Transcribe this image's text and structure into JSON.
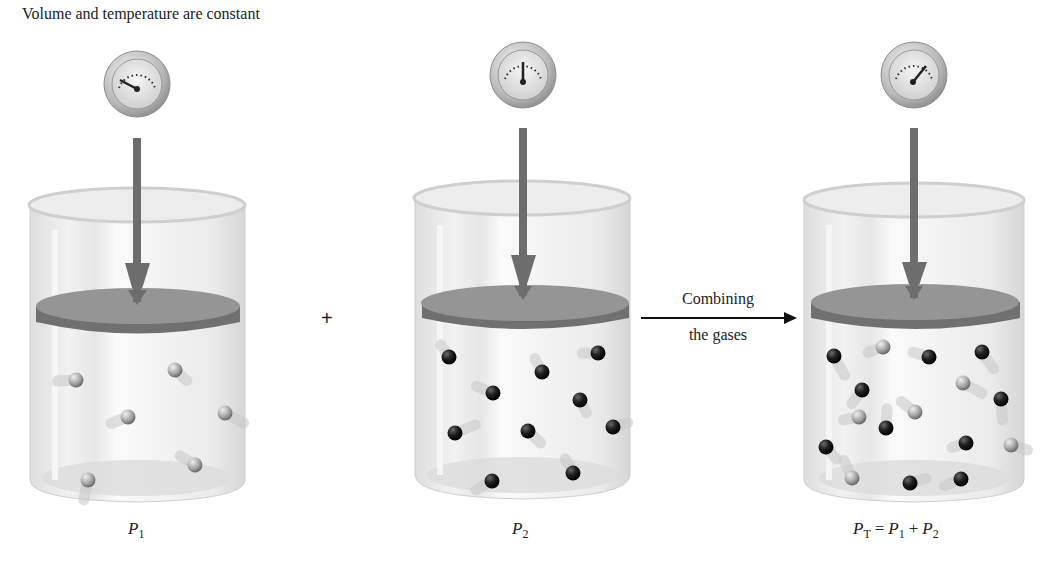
{
  "caption": "Volume and temperature are constant",
  "operators": {
    "plus": "+"
  },
  "process_arrow": {
    "label_top": "Combining",
    "label_bottom": "the gases"
  },
  "containers": [
    {
      "id": "gas-1",
      "label": {
        "var": "P",
        "sub": "1"
      },
      "gauge_needle_angle": -150,
      "molecules": [
        {
          "type": "light",
          "x": 76,
          "y": 380
        },
        {
          "type": "light",
          "x": 175,
          "y": 370
        },
        {
          "type": "light",
          "x": 128,
          "y": 417
        },
        {
          "type": "light",
          "x": 225,
          "y": 413
        },
        {
          "type": "light",
          "x": 195,
          "y": 465
        },
        {
          "type": "light",
          "x": 88,
          "y": 480
        }
      ]
    },
    {
      "id": "gas-2",
      "label": {
        "var": "P",
        "sub": "2"
      },
      "gauge_needle_angle": -90,
      "molecules": [
        {
          "type": "dark",
          "x": 449,
          "y": 357
        },
        {
          "type": "dark",
          "x": 598,
          "y": 353
        },
        {
          "type": "dark",
          "x": 542,
          "y": 372
        },
        {
          "type": "dark",
          "x": 493,
          "y": 393
        },
        {
          "type": "dark",
          "x": 580,
          "y": 400
        },
        {
          "type": "dark",
          "x": 455,
          "y": 433
        },
        {
          "type": "dark",
          "x": 528,
          "y": 431
        },
        {
          "type": "dark",
          "x": 613,
          "y": 427
        },
        {
          "type": "dark",
          "x": 492,
          "y": 481
        },
        {
          "type": "dark",
          "x": 573,
          "y": 473
        }
      ]
    },
    {
      "id": "gas-total",
      "label": {
        "expression": [
          {
            "var": "P",
            "sub": "T"
          },
          {
            "op": "="
          },
          {
            "var": "P",
            "sub": "1"
          },
          {
            "op": "+"
          },
          {
            "var": "P",
            "sub": "2"
          }
        ]
      },
      "gauge_needle_angle": -40,
      "molecules": [
        {
          "type": "dark",
          "x": 834,
          "y": 356
        },
        {
          "type": "light",
          "x": 883,
          "y": 347
        },
        {
          "type": "dark",
          "x": 929,
          "y": 357
        },
        {
          "type": "dark",
          "x": 982,
          "y": 352
        },
        {
          "type": "dark",
          "x": 862,
          "y": 390
        },
        {
          "type": "light",
          "x": 963,
          "y": 383
        },
        {
          "type": "dark",
          "x": 1001,
          "y": 399
        },
        {
          "type": "light",
          "x": 859,
          "y": 417
        },
        {
          "type": "light",
          "x": 915,
          "y": 412
        },
        {
          "type": "dark",
          "x": 886,
          "y": 428
        },
        {
          "type": "dark",
          "x": 826,
          "y": 447
        },
        {
          "type": "dark",
          "x": 966,
          "y": 443
        },
        {
          "type": "light",
          "x": 1011,
          "y": 445
        },
        {
          "type": "light",
          "x": 852,
          "y": 478
        },
        {
          "type": "dark",
          "x": 910,
          "y": 483
        },
        {
          "type": "dark",
          "x": 961,
          "y": 479
        }
      ]
    }
  ],
  "colors": {
    "beaker_glass": "#e9e9e9",
    "piston_top": "#8f8f8f",
    "piston_side": "#707070",
    "push_arrow": "#6d6d6d",
    "molecule_light": "#a8a8a8",
    "molecule_dark": "#1f1f1f"
  }
}
